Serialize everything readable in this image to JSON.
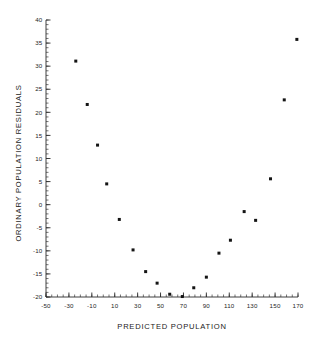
{
  "chart_data": {
    "type": "scatter",
    "title": "",
    "xlabel": "PREDICTED POPULATION",
    "ylabel": "ORDINARY POPULATION RESIDUALS",
    "xlim": [
      -50,
      170
    ],
    "ylim": [
      -20,
      40
    ],
    "xticks": [
      -50,
      -30,
      -10,
      10,
      30,
      50,
      70,
      90,
      110,
      130,
      150,
      170
    ],
    "xticklabels": [
      "-50",
      "-30",
      "-10",
      "10",
      "30",
      "50",
      "70",
      "90",
      "110",
      "130",
      "150",
      "170"
    ],
    "yticks": [
      -20,
      -15,
      -10,
      -5,
      0,
      5,
      10,
      15,
      20,
      25,
      30,
      35,
      40
    ],
    "yticklabels": [
      "-20",
      "-15",
      "-10",
      "-5",
      "0",
      "5",
      "10",
      "15",
      "20",
      "25",
      "30",
      "35",
      "40"
    ],
    "xtick_minor_step": 5,
    "ytick_minor_step": 1,
    "grid": false,
    "legend": null,
    "marker": "square",
    "marker_color": "#141414",
    "marker_size_px": 3,
    "points": [
      {
        "x": -24,
        "y": 31.1
      },
      {
        "x": -14,
        "y": 21.7
      },
      {
        "x": -5,
        "y": 12.9
      },
      {
        "x": 3,
        "y": 4.5
      },
      {
        "x": 14,
        "y": -3.2
      },
      {
        "x": 26,
        "y": -9.8
      },
      {
        "x": 37,
        "y": -14.5
      },
      {
        "x": 47,
        "y": -17.0
      },
      {
        "x": 58,
        "y": -19.4
      },
      {
        "x": 69,
        "y": -19.9
      },
      {
        "x": 79,
        "y": -18.0
      },
      {
        "x": 90,
        "y": -15.7
      },
      {
        "x": 101,
        "y": -10.5
      },
      {
        "x": 111,
        "y": -7.7
      },
      {
        "x": 123,
        "y": -1.5
      },
      {
        "x": 133,
        "y": -3.4
      },
      {
        "x": 146,
        "y": 5.6
      },
      {
        "x": 158,
        "y": 22.7
      },
      {
        "x": 169,
        "y": 35.8
      }
    ]
  },
  "figure": {
    "background_color": "#ffffff",
    "axis_color": "#2b2b2b"
  }
}
